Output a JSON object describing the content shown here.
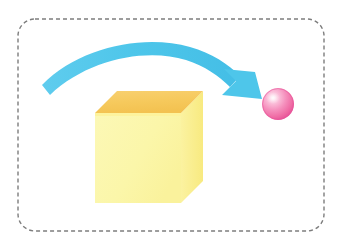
{
  "canvas": {
    "width": 350,
    "height": 247,
    "background": "#ffffff"
  },
  "frame": {
    "label": "dashed-boundary",
    "x": 18,
    "y": 19,
    "width": 306,
    "height": 212,
    "corner_radius": 17,
    "stroke_color": "#7d7d7d",
    "stroke_width": 1.4,
    "dash": "4 3",
    "fill": "none"
  },
  "cube": {
    "label": "yellow-cube",
    "front_face": {
      "color": "#fbf6a9",
      "points": "95,113 181,113 181,203 95,203"
    },
    "top_face": {
      "color": "#f6c95c",
      "points": "95,113 117,91 203,91 181,113"
    },
    "right_face": {
      "color": "#faee8c",
      "points": "181,113 203,91 203,181 181,203"
    },
    "top_edge_highlight": "#fdf29a"
  },
  "arrow": {
    "label": "curved-motion-arrow",
    "color": "#4ec6ea",
    "color_light": "#7fd8f2",
    "tail": {
      "x": 43,
      "y": 90
    },
    "tip": {
      "x": 262,
      "y": 99
    },
    "apex": {
      "x": 150,
      "y": 52
    },
    "thickness": 11,
    "head_width": 30,
    "head_length": 26,
    "direction": "left-to-right-arc"
  },
  "sphere": {
    "label": "pink-sphere",
    "center_x": 278,
    "center_y": 104,
    "radius": 16,
    "base_color": "#f06fa8",
    "mid_color": "#f79dc4",
    "highlight_color": "#fde4ef",
    "rim_color": "#e8559a",
    "highlight_offset_x": -5,
    "highlight_offset_y": -6
  },
  "description": {
    "concept": "A cube transforming or moving along a curved path into a sphere",
    "elements": [
      "dashed boundary",
      "yellow cube",
      "blue curved arrow",
      "pink sphere"
    ]
  }
}
